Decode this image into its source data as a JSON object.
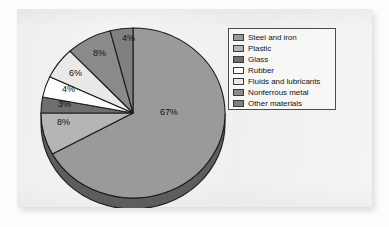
{
  "figure": {
    "background_color": "#f4f4f2",
    "page_color": "#fdfdfd"
  },
  "legend": {
    "border_color": "#4d4d4d",
    "background_color": "#f7f7f5",
    "items": [
      {
        "label": "Steel and iron",
        "color": "#9a9a9a"
      },
      {
        "label": "Plastic",
        "color": "#b5b5b5"
      },
      {
        "label": "Glass",
        "color": "#6f6f6f"
      },
      {
        "label": "Rubber",
        "color": "#fdfdfd"
      },
      {
        "label": "Fluids and lubricants",
        "color": "#e9e9e7"
      },
      {
        "label": "Nonferrous metal",
        "color": "#8a8a8a"
      },
      {
        "label": "Other materials",
        "color": "#808080"
      }
    ]
  },
  "chart_data": {
    "type": "pie",
    "title": "",
    "subtitle": "",
    "xlabel": "",
    "ylabel": "",
    "legend_position": "right",
    "grid": false,
    "start_angle_deg": 0,
    "direction": "clockwise",
    "three_d": true,
    "categories": [
      "Steel and iron",
      "Plastic",
      "Glass",
      "Rubber",
      "Fluids and lubricants",
      "Nonferrous metal",
      "Other materials"
    ],
    "values": [
      67,
      8,
      3,
      4,
      6,
      8,
      4
    ],
    "value_unit": "%",
    "data_labels": [
      "67%",
      "8%",
      "3%",
      "4%",
      "6%",
      "8%",
      "4%"
    ],
    "colors": [
      "#9a9a9a",
      "#b5b5b5",
      "#6f6f6f",
      "#fdfdfd",
      "#e9e9e7",
      "#8a8a8a",
      "#808080"
    ],
    "slice_edge_color": "#1c1c1c",
    "depth_color": "#5d5d5d"
  },
  "slice_labels": [
    {
      "text": "67%",
      "left": 160,
      "top": 108
    },
    {
      "text": "8%",
      "left": 57,
      "top": 118
    },
    {
      "text": "3%",
      "left": 58,
      "top": 100
    },
    {
      "text": "4%",
      "left": 62,
      "top": 85
    },
    {
      "text": "6%",
      "left": 69,
      "top": 69
    },
    {
      "text": "8%",
      "left": 93,
      "top": 49
    },
    {
      "text": "4%",
      "left": 122,
      "top": 34
    }
  ]
}
